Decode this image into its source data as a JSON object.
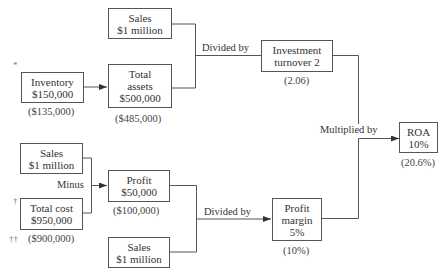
{
  "diagram": {
    "type": "roa-dupont-flowchart",
    "nodes": {
      "sales_top": {
        "lines": [
          "Sales",
          "$1 million"
        ],
        "note": ""
      },
      "inventory": {
        "lines": [
          "Inventory",
          "$150,000"
        ],
        "note": "($135,000)",
        "marker": "*"
      },
      "total_assets": {
        "lines": [
          "Total",
          "assets",
          "$500,000"
        ],
        "note": "($485,000)"
      },
      "investment_turnover": {
        "lines": [
          "Investment",
          "turnover 2"
        ],
        "note": "(2.06)"
      },
      "roa": {
        "lines": [
          "ROA",
          "10%"
        ],
        "note": "(20.6%)"
      },
      "sales_left": {
        "lines": [
          "Sales",
          "$1 million"
        ],
        "note": ""
      },
      "total_cost": {
        "lines": [
          "Total cost",
          "$950,000"
        ],
        "note": "($900,000)",
        "marker": "†",
        "note_marker": "††"
      },
      "profit": {
        "lines": [
          "Profit",
          "$50,000"
        ],
        "note": "($100,000)"
      },
      "sales_bottom": {
        "lines": [
          "Sales",
          "$1 million"
        ],
        "note": ""
      },
      "profit_margin": {
        "lines": [
          "Profit",
          "margin",
          "5%"
        ],
        "note": "(10%)"
      }
    },
    "operators": {
      "divided_top": "Divided by",
      "multiplied": "Multiplied by",
      "minus": "Minus",
      "divided_bottom": "Divided by"
    },
    "edges": [
      {
        "from": "inventory",
        "to": "total_assets",
        "arrow": true
      },
      {
        "from": [
          "sales_top",
          "total_assets"
        ],
        "op": "Divided by",
        "to": "investment_turnover"
      },
      {
        "from": [
          "investment_turnover",
          "profit_margin"
        ],
        "op": "Multiplied by",
        "to": "roa",
        "arrow": true
      },
      {
        "from": [
          "sales_left",
          "total_cost"
        ],
        "op": "Minus",
        "to": "profit",
        "arrow": true
      },
      {
        "from": [
          "profit",
          "sales_bottom"
        ],
        "op": "Divided by",
        "to": "profit_margin",
        "arrow": true
      }
    ],
    "colors": {
      "line": "#555555",
      "text": "#333333",
      "background": "#ffffff"
    }
  }
}
